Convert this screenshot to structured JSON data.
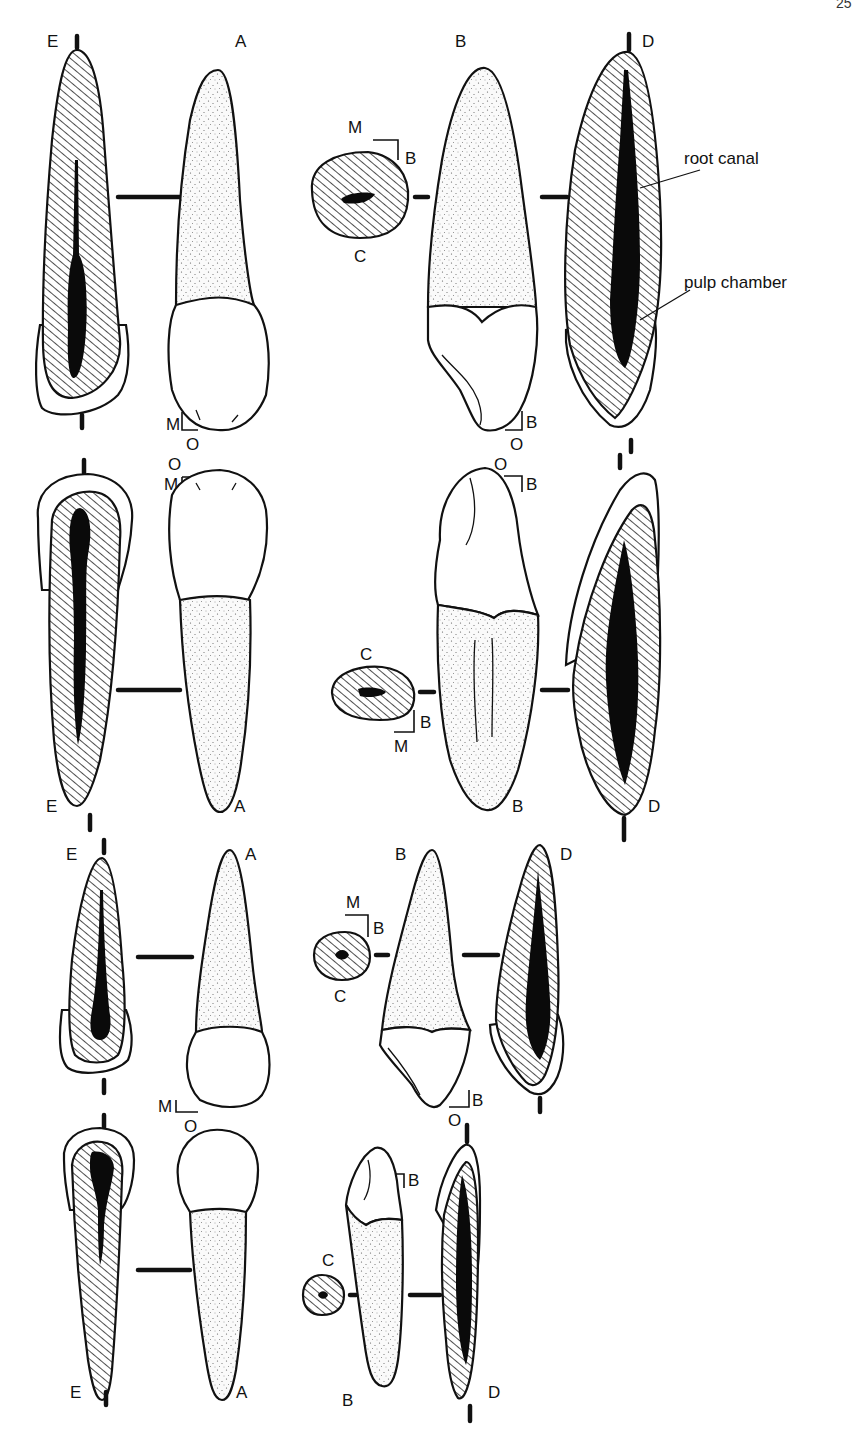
{
  "figure": {
    "page_number": "25",
    "callouts": {
      "root_canal": "root canal",
      "pulp_chamber": "pulp chamber"
    },
    "rows": [
      {
        "id": "row-1",
        "views": {
          "E": "E",
          "A": "A",
          "B": "B",
          "C": "C",
          "D": "D"
        },
        "axes": {
          "A_corner": {
            "v": "M",
            "h": "O"
          },
          "B_corner": {
            "v": "B",
            "h": "O"
          },
          "C_corner": {
            "top": "M",
            "side": "B"
          }
        }
      },
      {
        "id": "row-2",
        "views": {
          "E": "E",
          "A": "A",
          "B": "B",
          "C": "C",
          "D": "D"
        },
        "axes": {
          "A_corner": {
            "top": "O",
            "side": "M"
          },
          "B_corner": {
            "top": "O",
            "side": "B"
          },
          "C_corner": {
            "side": "B",
            "bottom": "M"
          }
        }
      },
      {
        "id": "row-3",
        "views": {
          "E": "E",
          "A": "A",
          "B": "B",
          "C": "C",
          "D": "D"
        },
        "axes": {
          "A_corner": {
            "v": "M",
            "h": "O"
          },
          "B_corner": {
            "side": "B",
            "bottom": "O"
          },
          "C_corner": {
            "top": "M",
            "side": "B"
          }
        }
      },
      {
        "id": "row-4",
        "views": {
          "E": "E",
          "A": "A",
          "B": "B",
          "C": "C",
          "D": "D"
        },
        "axes": {
          "B_corner": {
            "top": "O",
            "side": "B"
          }
        }
      }
    ]
  }
}
